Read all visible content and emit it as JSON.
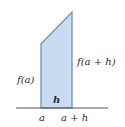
{
  "diagram": {
    "type": "trapezoid-area-approximation",
    "colors": {
      "fill": "#c9dcef",
      "stroke": "#6f93b8",
      "axis": "#555555",
      "text": "#2a2a2a"
    },
    "labels": {
      "left_height": "f(a)",
      "right_height": "f(a + h)",
      "width": "h",
      "x_left": "a",
      "x_right": "a + h"
    }
  }
}
